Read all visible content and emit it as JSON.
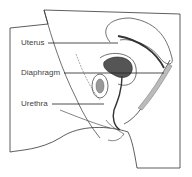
{
  "diagram": {
    "labels": [
      {
        "id": "uterus",
        "text": "Uterus"
      },
      {
        "id": "diaphragm",
        "text": "Diaphragm"
      },
      {
        "id": "urethra",
        "text": "Urethra"
      }
    ]
  }
}
